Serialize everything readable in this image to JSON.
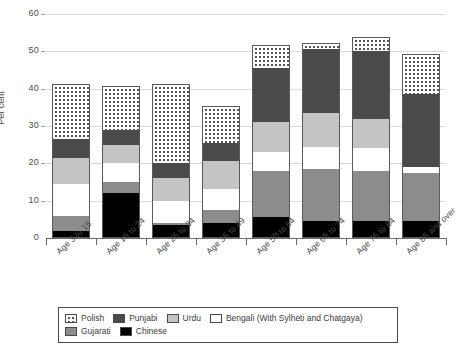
{
  "chart_data": {
    "type": "bar",
    "subtype": "stacked-bar",
    "title": "",
    "xlabel": "",
    "ylabel": "Per cent",
    "ylim": [
      0,
      60
    ],
    "yticks": [
      0,
      10,
      20,
      30,
      40,
      50,
      60
    ],
    "ytick_labels": [
      "0",
      "10",
      "20",
      "30",
      "40",
      "50",
      "60"
    ],
    "grid": true,
    "legend_position": "bottom",
    "categories": [
      "Age 3 to 15",
      "Age 16 to 24",
      "Age 25 to 34",
      "Age 35 to 49",
      "Age 50 to 64",
      "Age 65 to 74",
      "Age 75 to 84",
      "Age 85 and over"
    ],
    "series": [
      {
        "name": "Chinese",
        "key": "chinese",
        "color": "#000000",
        "values": [
          2.0,
          12.0,
          3.5,
          4.0,
          5.5,
          4.5,
          4.5,
          4.5
        ]
      },
      {
        "name": "Gujarati",
        "key": "gujarati",
        "color": "#8c8c8c",
        "values": [
          4.0,
          3.0,
          0.5,
          3.5,
          12.5,
          14.0,
          13.5,
          13.0
        ]
      },
      {
        "name": "Bengali (With Sylheti and Chatgaya)",
        "key": "bengali",
        "color": "#ffffff",
        "values": [
          8.5,
          5.0,
          6.0,
          5.5,
          5.0,
          6.0,
          6.0,
          1.5
        ]
      },
      {
        "name": "Urdu",
        "key": "urdu",
        "color": "#c4c4c4",
        "values": [
          7.0,
          5.0,
          6.0,
          7.5,
          8.0,
          9.0,
          8.0,
          0.0
        ]
      },
      {
        "name": "Punjabi",
        "key": "punjabi",
        "color": "#4a4a4a",
        "values": [
          5.0,
          4.0,
          4.0,
          5.0,
          14.5,
          17.0,
          18.0,
          19.5
        ]
      },
      {
        "name": "Polish",
        "key": "polish",
        "color": "#ffffff",
        "values": [
          14.5,
          11.5,
          21.0,
          9.5,
          6.0,
          1.5,
          3.5,
          10.5
        ]
      }
    ],
    "totals": [
      41.0,
      40.5,
      41.0,
      35.0,
      51.5,
      52.0,
      53.5,
      49.0
    ],
    "legend_entries": [
      {
        "label": "Polish",
        "key": "polish"
      },
      {
        "label": "Punjabi",
        "key": "punjabi"
      },
      {
        "label": "Urdu",
        "key": "urdu"
      },
      {
        "label": "Bengali (With Sylheti and Chatgaya)",
        "key": "bengali"
      },
      {
        "label": "Gujarati",
        "key": "gujarati"
      },
      {
        "label": "Chinese",
        "key": "chinese"
      }
    ],
    "legend_rows": [
      [
        "Polish",
        "Punjabi",
        "Urdu",
        "Bengali (With Sylheti and Chatgaya)"
      ],
      [
        "Gujarati",
        "Chinese"
      ]
    ]
  }
}
